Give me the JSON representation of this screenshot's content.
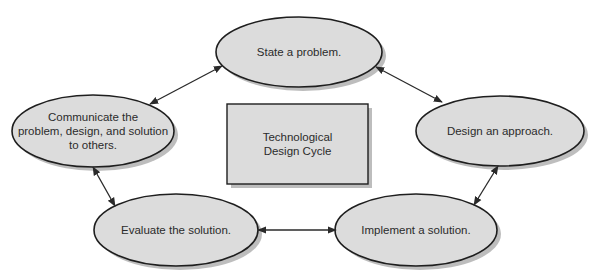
{
  "diagram": {
    "type": "cycle",
    "colors": {
      "node_fill": "#dcdcdc",
      "node_stroke": "#1e1e1e",
      "shadow": "#9a9a9a",
      "arrow": "#2a2a2a",
      "background": "#ffffff"
    },
    "center": {
      "label": "Technological\nDesign Cycle",
      "shape": "rectangle"
    },
    "nodes": [
      {
        "id": "state",
        "label": "State a problem.",
        "shape": "ellipse"
      },
      {
        "id": "design",
        "label": "Design an approach.",
        "shape": "ellipse"
      },
      {
        "id": "implement",
        "label": "Implement a solution.",
        "shape": "ellipse"
      },
      {
        "id": "evaluate",
        "label": "Evaluate the solution.",
        "shape": "ellipse"
      },
      {
        "id": "communicate",
        "label": "Communicate the\nproblem, design, and solution\nto others.",
        "shape": "ellipse"
      }
    ],
    "edges": [
      {
        "from": "state",
        "to": "design",
        "direction": "both"
      },
      {
        "from": "design",
        "to": "implement",
        "direction": "both"
      },
      {
        "from": "implement",
        "to": "evaluate",
        "direction": "both"
      },
      {
        "from": "evaluate",
        "to": "communicate",
        "direction": "both"
      },
      {
        "from": "communicate",
        "to": "state",
        "direction": "both"
      }
    ]
  }
}
